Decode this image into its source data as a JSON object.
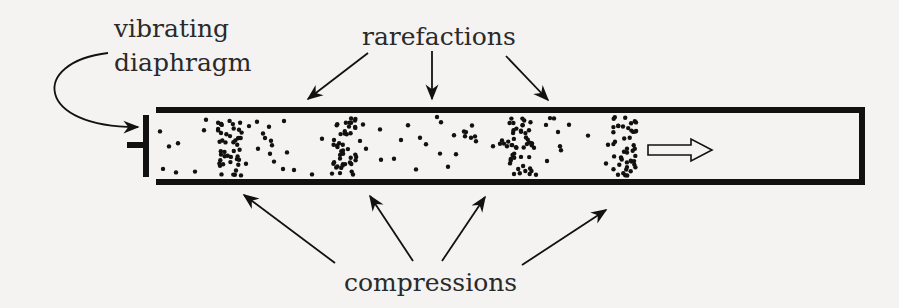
{
  "labels": {
    "diaphragm_line1": "vibrating",
    "diaphragm_line2": "diaphragm",
    "rarefactions": "rarefactions",
    "compressions": "compressions"
  },
  "colors": {
    "background": "#f4f3f1",
    "ink": "#111111",
    "text": "#2a2a2a"
  },
  "tube": {
    "left": 156,
    "right": 862,
    "top": 110,
    "bottom": 182,
    "wall_thickness": 6,
    "right_end_closed": true
  },
  "diaphragm": {
    "x": 146,
    "top": 115,
    "bottom": 176,
    "stem_from_x": 127,
    "stem_y": 145
  },
  "compression_centers_x": [
    230,
    345,
    520,
    625
  ],
  "rarefaction_arrow_targets": [
    [
      310,
      100
    ],
    [
      432,
      100
    ],
    [
      548,
      100
    ]
  ],
  "compression_arrow_targets": [
    [
      243,
      196
    ],
    [
      370,
      196
    ],
    [
      485,
      196
    ],
    [
      640,
      196
    ]
  ],
  "propagation_arrow": {
    "x1": 648,
    "x2": 712,
    "y": 150,
    "icon": "hollow-right-arrow"
  }
}
